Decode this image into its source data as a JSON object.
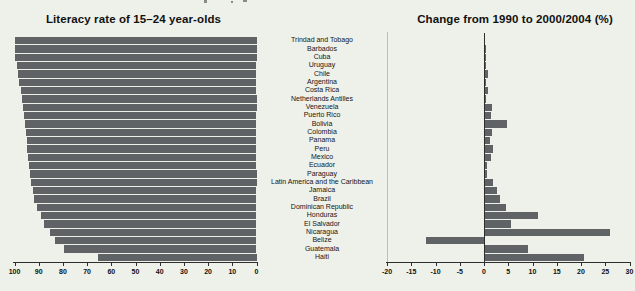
{
  "colors": {
    "background": "#eef0ea",
    "bar": "#5f6366",
    "axis": "#2e2e2e",
    "frame_line": "#bcbeb8",
    "text": "#111111"
  },
  "chart_data": [
    {
      "type": "bar",
      "orientation": "horizontal",
      "title": "Literacy rate of 15–24 year-olds",
      "categories": [
        "Trindad and Tobago",
        "Barbados",
        "Cuba",
        "Uruguay",
        "Chile",
        "Argentina",
        "Costa Rica",
        "Netherlands Antilles",
        "Venezuela",
        "Puerto Rico",
        "Bolivia",
        "Colombia",
        "Panama",
        "Peru",
        "Mexico",
        "Ecuador",
        "Paraguay",
        "Latin America and the Caribbean",
        "Jamaica",
        "Brazil",
        "Dominican Republic",
        "Honduras",
        "El Salvador",
        "Nicaragua",
        "Belize",
        "Guatemala",
        "Haiti"
      ],
      "values": [
        99.8,
        99.8,
        99.8,
        99.1,
        98.6,
        98.2,
        97.5,
        97.1,
        96.7,
        96.1,
        95.7,
        95.3,
        95.0,
        94.7,
        94.3,
        93.9,
        93.6,
        93.4,
        92.5,
        91.8,
        90.8,
        88.9,
        87.7,
        85.2,
        83.2,
        79.4,
        65.5
      ],
      "xlim": [
        100,
        0
      ],
      "axis_reversed": true,
      "ticks": [
        100,
        90,
        80,
        70,
        60,
        50,
        40,
        30,
        20,
        10,
        0
      ],
      "grid": false,
      "legend": "none"
    },
    {
      "type": "bar",
      "orientation": "horizontal",
      "title": "Change from 1990 to 2000/2004 (%)",
      "categories": [
        "Trindad and Tobago",
        "Barbados",
        "Cuba",
        "Uruguay",
        "Chile",
        "Argentina",
        "Costa Rica",
        "Netherlands Antilles",
        "Venezuela",
        "Puerto Rico",
        "Bolivia",
        "Colombia",
        "Panama",
        "Peru",
        "Mexico",
        "Ecuador",
        "Paraguay",
        "Latin America and the Caribbean",
        "Jamaica",
        "Brazil",
        "Dominican Republic",
        "Honduras",
        "El Salvador",
        "Nicaragua",
        "Belize",
        "Guatemala",
        "Haiti"
      ],
      "values": [
        0.1,
        0.4,
        0.5,
        0.3,
        0.8,
        0.3,
        0.8,
        0.5,
        1.7,
        1.4,
        4.8,
        1.7,
        1.2,
        1.8,
        1.4,
        0.7,
        0.6,
        1.9,
        2.6,
        3.3,
        4.5,
        11.2,
        5.6,
        26.0,
        -12.0,
        9.0,
        20.7
      ],
      "xlim": [
        -20,
        30
      ],
      "ticks": [
        -20,
        -15,
        -10,
        -5,
        0,
        5,
        10,
        15,
        20,
        25,
        30
      ],
      "grid": false,
      "legend": "none"
    }
  ]
}
